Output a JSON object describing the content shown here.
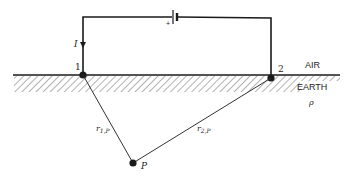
{
  "diagram": {
    "labels": {
      "current": "I",
      "electrode1": "1",
      "electrode2": "2",
      "air": "AIR",
      "earth": "EARTH",
      "resistivity": "ρ",
      "point": "P",
      "r1p_main": "r",
      "r1p_sub": "1,P",
      "r2p_main": "r",
      "r2p_sub": "2,P",
      "battery_plus": "+"
    },
    "colors": {
      "line": "#1a1a1a",
      "hatch": "#555555"
    }
  }
}
